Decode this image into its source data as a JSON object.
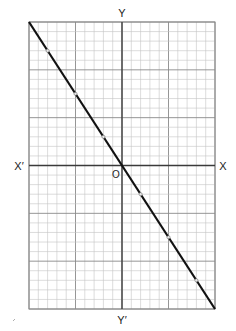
{
  "chart_data": {
    "type": "line",
    "title": "",
    "xlabel": "X",
    "xlabel_negative": "X′",
    "ylabel": "Y",
    "ylabel_negative": "Y′",
    "origin_label": "O",
    "xlim": [
      -10,
      10
    ],
    "ylim": [
      -15,
      15
    ],
    "grid": true,
    "grid_minor_step": 1,
    "grid_major_step": 5,
    "legend": null,
    "series": [
      {
        "name": "y = -1.5x",
        "equation": "y = -1.5x",
        "line_from": [
          -10,
          15
        ],
        "line_to": [
          10,
          -15
        ],
        "points": [
          {
            "x": -8,
            "y": 12
          },
          {
            "x": -5,
            "y": 7.5
          },
          {
            "x": -2,
            "y": 3
          },
          {
            "x": 0,
            "y": 0
          },
          {
            "x": 2,
            "y": -3
          },
          {
            "x": 5,
            "y": -7.5
          },
          {
            "x": 8,
            "y": -12
          }
        ]
      }
    ],
    "colors": {
      "line": "#111111",
      "axis": "#3a3a3a",
      "grid_minor": "#c4c4c4",
      "grid_major": "#8a8a8a",
      "marker_fill": "#e8e8e8"
    }
  }
}
